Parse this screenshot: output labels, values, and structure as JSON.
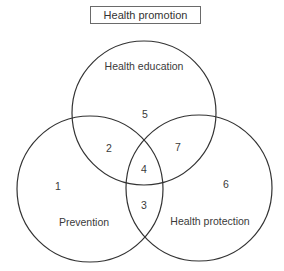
{
  "title": "Health promotion",
  "circles": [
    {
      "name": "Health education",
      "cx": 144,
      "cy": 113,
      "r": 72
    },
    {
      "name": "Prevention",
      "cx": 90,
      "cy": 189,
      "r": 73
    },
    {
      "name": "Health protection",
      "cx": 199,
      "cy": 188,
      "r": 73
    }
  ],
  "labels": {
    "health_education": "Health education",
    "prevention": "Prevention",
    "health_protection": "Health protection"
  },
  "regions": {
    "r1": "1",
    "r2": "2",
    "r3": "3",
    "r4": "4",
    "r5": "5",
    "r6": "6",
    "r7": "7"
  },
  "stroke_color": "#333333"
}
